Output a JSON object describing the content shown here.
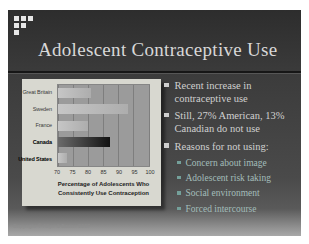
{
  "slide": {
    "title": "Adolescent Contraceptive Use",
    "footer": "Copyright © Allyn & Bacon 2007",
    "logo_pattern": [
      [
        1,
        1,
        1
      ],
      [
        1,
        1,
        0
      ],
      [
        1,
        0,
        0
      ]
    ],
    "bullets": [
      {
        "level": 1,
        "text": "Recent increase in contraceptive use"
      },
      {
        "level": 1,
        "text": "Still, 27% American, 13% Canadian do not use"
      },
      {
        "level": 1,
        "text": "Reasons for not using:"
      },
      {
        "level": 2,
        "text": "Concern about image"
      },
      {
        "level": 2,
        "text": "Adolescent risk taking"
      },
      {
        "level": 2,
        "text": "Social environment"
      },
      {
        "level": 2,
        "text": "Forced intercourse"
      }
    ],
    "colors": {
      "slide_bg_top": "#2d2d2d",
      "slide_bg_mid": "#4a4a4a",
      "slide_bg_bottom": "#a8a8a8",
      "title": "#d8d8d8",
      "bullet_text": "#d0d0d0",
      "sub_bullet_text": "#a3bdba",
      "sub_marker": "#74a09a",
      "card_bg": "#d8d8d0",
      "plot_bg": "#9b9b9b",
      "grid_line": "#7e7e7e",
      "bar": "#adadad",
      "bar_highlight_start": "#6b6b6b",
      "bar_highlight_end": "#121212"
    }
  },
  "chart_data": {
    "type": "bar",
    "orientation": "horizontal",
    "title": "",
    "categories": [
      "Great Britain",
      "Sweden",
      "France",
      "Canada",
      "United States"
    ],
    "values": [
      81,
      93,
      80,
      87,
      73
    ],
    "highlight_bar": "Canada",
    "emphasized_labels": [
      "Canada",
      "United States"
    ],
    "xlabel_lines": [
      "Percentage of Adolescents Who",
      "Consistently Use Contraception"
    ],
    "xlabel": "Percentage of Adolescents Who Consistently Use Contraception",
    "xlim": [
      70,
      100
    ],
    "xticks": [
      70,
      75,
      80,
      85,
      90,
      95,
      100
    ],
    "grid": true,
    "legend": false
  }
}
